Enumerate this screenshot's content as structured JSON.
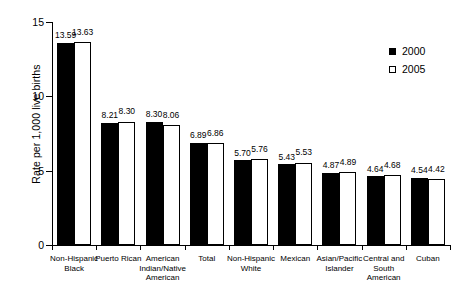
{
  "chart_data": {
    "type": "bar",
    "title": "",
    "xlabel": "",
    "ylabel": "Rate per 1,000 live births",
    "ylim": [
      0,
      15
    ],
    "yticks": [
      "0",
      "5",
      "10",
      "15"
    ],
    "grid": false,
    "legend_position": "top-right",
    "categories": [
      "Non-Hispanic Black",
      "Puerto Rican",
      "American Indian/Native American",
      "Total",
      "Non-Hispanic White",
      "Mexican",
      "Asian/Pacific Islander",
      "Central and South American",
      "Cuban"
    ],
    "category_lines": [
      [
        "Non-Hispanic",
        "Black"
      ],
      [
        "Puerto Rican"
      ],
      [
        "American",
        "Indian/Native",
        "American"
      ],
      [
        "Total"
      ],
      [
        "Non-Hispanic",
        "White"
      ],
      [
        "Mexican"
      ],
      [
        "Asian/Pacific",
        "Islander"
      ],
      [
        "Central and",
        "South",
        "American"
      ],
      [
        "Cuban"
      ]
    ],
    "series": [
      {
        "name": "2000",
        "color": "#000000",
        "values": [
          13.59,
          8.21,
          8.3,
          6.89,
          5.7,
          5.43,
          4.87,
          4.64,
          4.54
        ],
        "labels": [
          "13.59",
          "8.21",
          "8.30",
          "6.89",
          "5.70",
          "5.43",
          "4.87",
          "4.64",
          "4.54"
        ]
      },
      {
        "name": "2005",
        "color": "#ffffff",
        "values": [
          13.63,
          8.3,
          8.06,
          6.86,
          5.76,
          5.53,
          4.89,
          4.68,
          4.42
        ],
        "labels": [
          "13.63",
          "8.30",
          "8.06",
          "6.86",
          "5.76",
          "5.53",
          "4.89",
          "4.68",
          "4.42"
        ]
      }
    ]
  },
  "legend": {
    "items": [
      {
        "label": "2000",
        "swatch": "filled-square-icon"
      },
      {
        "label": "2005",
        "swatch": "hollow-square-icon"
      }
    ]
  },
  "axes": {
    "y_title": "Rate per 1,000 live births",
    "y_tick_labels": [
      "15",
      "10",
      "5",
      "0"
    ]
  }
}
